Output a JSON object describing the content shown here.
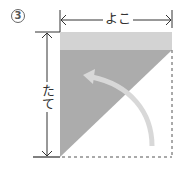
{
  "step": {
    "number": "3"
  },
  "labels": {
    "width": "よこ",
    "height": "たて"
  },
  "colors": {
    "light_band": "#d3d3d3",
    "triangle": "#acacac",
    "fold_arrow": "#d8d8d8",
    "lines": "#333333",
    "dashed": "#555555"
  }
}
